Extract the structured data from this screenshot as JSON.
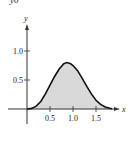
{
  "corner_text": "y0",
  "chart_data": {
    "type": "area",
    "title": "",
    "xlabel": "x",
    "ylabel": "y",
    "x_ticks": [
      0.5,
      1.0,
      1.5
    ],
    "x_tick_labels": [
      "0.5",
      "1.0",
      "1.5"
    ],
    "y_ticks": [
      0.5,
      1.0
    ],
    "y_tick_labels": [
      "0.5",
      "1.0"
    ],
    "xlim": [
      0,
      1.95
    ],
    "ylim": [
      0,
      1.3
    ],
    "grid": false,
    "legend": null,
    "fill_color": "#d9d9d9",
    "line_color": "#111111",
    "shaded_region": {
      "from": 0,
      "to": 1.85
    },
    "x": [
      0,
      0.1,
      0.2,
      0.3,
      0.4,
      0.5,
      0.6,
      0.7,
      0.8,
      0.87,
      0.95,
      1.0,
      1.1,
      1.2,
      1.3,
      1.4,
      1.5,
      1.6,
      1.7,
      1.8,
      1.85
    ],
    "values": [
      0,
      0.01,
      0.05,
      0.13,
      0.26,
      0.41,
      0.56,
      0.69,
      0.78,
      0.8,
      0.78,
      0.75,
      0.66,
      0.53,
      0.39,
      0.26,
      0.15,
      0.08,
      0.035,
      0.012,
      0.006
    ]
  }
}
